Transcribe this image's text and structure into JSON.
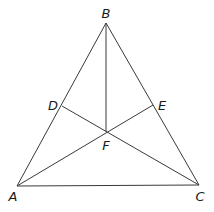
{
  "diagram": {
    "points": {
      "A": {
        "label": "A",
        "x": 17,
        "y": 186,
        "lx": 13,
        "ly": 201
      },
      "B": {
        "label": "B",
        "x": 106,
        "y": 23,
        "lx": 106,
        "ly": 18
      },
      "C": {
        "label": "C",
        "x": 199,
        "y": 185,
        "lx": 200,
        "ly": 201
      },
      "D": {
        "label": "D",
        "x": 62,
        "y": 106,
        "lx": 53,
        "ly": 110
      },
      "E": {
        "label": "E",
        "x": 153,
        "y": 105,
        "lx": 162,
        "ly": 110
      },
      "F": {
        "label": "F",
        "x": 106,
        "y": 132,
        "lx": 106,
        "ly": 150
      }
    },
    "segments": [
      [
        "A",
        "B"
      ],
      [
        "B",
        "C"
      ],
      [
        "A",
        "C"
      ],
      [
        "B",
        "F"
      ],
      [
        "D",
        "C"
      ],
      [
        "A",
        "E"
      ]
    ]
  }
}
